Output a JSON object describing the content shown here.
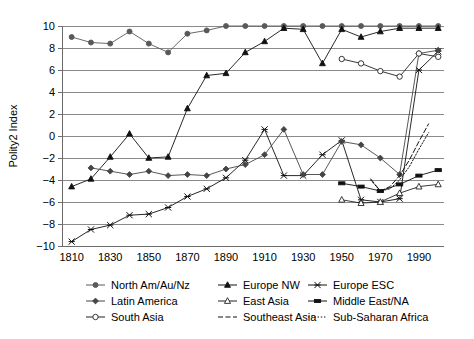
{
  "chart_data": {
    "type": "line",
    "title": "",
    "xlabel": "",
    "ylabel": "Polity2 Index",
    "xlim": [
      1805,
      2000
    ],
    "ylim": [
      -10,
      10
    ],
    "grid": true,
    "legend_position": "bottom",
    "x_ticks": [
      1810,
      1830,
      1850,
      1870,
      1890,
      1910,
      1930,
      1950,
      1970,
      1990
    ],
    "y_ticks": [
      -10,
      -8,
      -6,
      -4,
      -2,
      0,
      2,
      4,
      6,
      8,
      10
    ],
    "series": [
      {
        "name": "North Am/Au/Nz",
        "marker": "filled-circle",
        "linestyle": "solid",
        "color": "#595959",
        "x": [
          1810,
          1820,
          1830,
          1840,
          1850,
          1860,
          1870,
          1880,
          1890,
          1900,
          1910,
          1920,
          1930,
          1940,
          1950,
          1960,
          1970,
          1980,
          1990,
          2000
        ],
        "values": [
          9.0,
          8.5,
          8.4,
          9.5,
          8.4,
          7.6,
          9.3,
          9.6,
          10.0,
          10.0,
          10.0,
          10.0,
          10.0,
          10.0,
          10.0,
          10.0,
          10.0,
          10.0,
          10.0,
          10.0
        ]
      },
      {
        "name": "Europe NW",
        "marker": "filled-triangle",
        "linestyle": "solid",
        "color": "#111111",
        "x": [
          1810,
          1820,
          1830,
          1840,
          1850,
          1860,
          1870,
          1880,
          1890,
          1900,
          1910,
          1920,
          1930,
          1940,
          1950,
          1960,
          1970,
          1980,
          1990,
          2000
        ],
        "values": [
          -4.6,
          -3.9,
          -1.9,
          0.2,
          -2.0,
          -1.9,
          2.5,
          5.5,
          5.7,
          7.6,
          8.6,
          9.8,
          9.7,
          6.6,
          9.7,
          9.0,
          9.5,
          9.8,
          9.8,
          9.8
        ]
      },
      {
        "name": "Europe ESC",
        "marker": "cross-x",
        "linestyle": "solid",
        "color": "#111111",
        "x": [
          1810,
          1820,
          1830,
          1840,
          1850,
          1860,
          1870,
          1880,
          1890,
          1900,
          1910,
          1920,
          1930,
          1940,
          1950,
          1960,
          1970,
          1980,
          1990,
          2000
        ],
        "values": [
          -9.6,
          -8.5,
          -8.1,
          -7.2,
          -7.1,
          -6.5,
          -5.5,
          -4.8,
          -3.8,
          -2.2,
          0.6,
          -3.6,
          -3.6,
          -1.7,
          -0.4,
          -5.8,
          -6.0,
          -5.7,
          6.0,
          7.7
        ]
      },
      {
        "name": "Latin America",
        "marker": "filled-diamond",
        "linestyle": "solid",
        "color": "#454545",
        "x": [
          1820,
          1830,
          1840,
          1850,
          1860,
          1870,
          1880,
          1890,
          1900,
          1910,
          1920,
          1930,
          1940,
          1950,
          1960,
          1970,
          1980,
          1990,
          2000
        ],
        "values": [
          -2.9,
          -3.2,
          -3.5,
          -3.2,
          -3.6,
          -3.5,
          -3.6,
          -3.0,
          -2.6,
          -1.7,
          0.6,
          -3.5,
          -3.5,
          -0.5,
          -0.8,
          -2.0,
          -3.5,
          7.5,
          7.8
        ]
      },
      {
        "name": "South Asia",
        "marker": "open-circle",
        "linestyle": "solid",
        "color": "#222222",
        "x": [
          1950,
          1960,
          1970,
          1980,
          1990,
          2000
        ],
        "values": [
          7.0,
          6.6,
          5.9,
          5.4,
          7.5,
          7.2
        ]
      },
      {
        "name": "East Asia",
        "marker": "open-triangle",
        "linestyle": "solid",
        "color": "#222222",
        "x": [
          1950,
          1960,
          1970,
          1980,
          1990,
          2000
        ],
        "values": [
          -5.8,
          -6.1,
          -6.0,
          -5.2,
          -4.6,
          -4.4
        ]
      },
      {
        "name": "Middle East/NA",
        "marker": "filled-rect",
        "linestyle": "solid",
        "color": "#111111",
        "x": [
          1950,
          1960,
          1970,
          1980,
          1990,
          2000
        ],
        "values": [
          -4.3,
          -4.6,
          -5.0,
          -4.4,
          -3.6,
          -3.1
        ]
      },
      {
        "name": "Southeast Asia",
        "marker": "none",
        "linestyle": "dashed",
        "color": "#111111",
        "x": [
          1965,
          1970,
          1975,
          1980,
          1985,
          1990,
          1995
        ],
        "values": [
          -3.9,
          -5.0,
          -4.6,
          -3.6,
          -2.2,
          -0.5,
          1.1
        ]
      },
      {
        "name": "Sub-Saharan Africa",
        "marker": "none",
        "linestyle": "dotted",
        "color": "#111111",
        "x": [
          1965,
          1970,
          1975,
          1980,
          1985,
          1990,
          1995
        ],
        "values": [
          -4.0,
          -5.0,
          -4.8,
          -4.0,
          -2.8,
          -1.2,
          0.3
        ]
      }
    ]
  },
  "legend": {
    "entries": [
      {
        "label": "North Am/Au/Nz",
        "marker": "filled-circle",
        "linestyle": "solid",
        "color": "#595959"
      },
      {
        "label": "Europe NW",
        "marker": "filled-triangle",
        "linestyle": "solid",
        "color": "#111111"
      },
      {
        "label": "Europe ESC",
        "marker": "cross-x",
        "linestyle": "solid",
        "color": "#111111"
      },
      {
        "label": "Latin America",
        "marker": "filled-diamond",
        "linestyle": "solid",
        "color": "#454545"
      },
      {
        "label": "East Asia",
        "marker": "open-triangle",
        "linestyle": "solid",
        "color": "#222222"
      },
      {
        "label": "Middle East/NA",
        "marker": "filled-rect",
        "linestyle": "solid",
        "color": "#111111"
      },
      {
        "label": "South Asia",
        "marker": "open-circle",
        "linestyle": "solid",
        "color": "#222222"
      },
      {
        "label": "Southeast Asia",
        "marker": "none",
        "linestyle": "dashed",
        "color": "#111111"
      },
      {
        "label": "Sub-Saharan Africa",
        "marker": "none",
        "linestyle": "dotted",
        "color": "#111111"
      }
    ]
  },
  "colors": {
    "grid": "#8a8a8a",
    "axis": "#6d6d6d",
    "text": "#000000",
    "background": "#ffffff"
  }
}
